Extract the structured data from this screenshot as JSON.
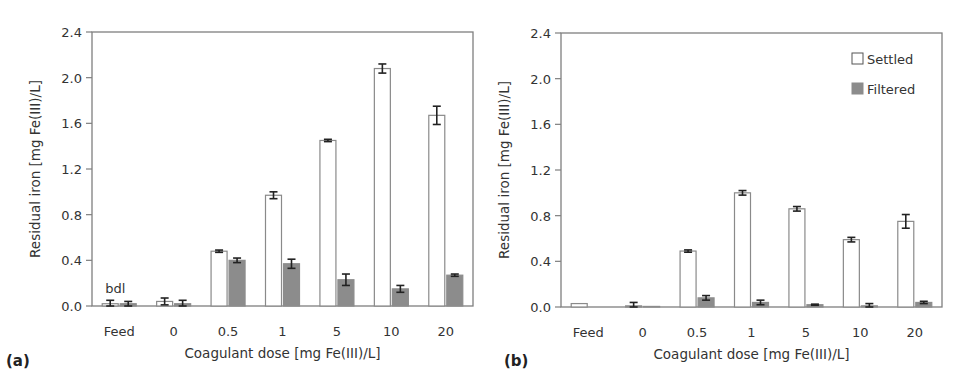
{
  "chart_data": [
    {
      "panel": "(a)",
      "type": "bar",
      "title": "",
      "xlabel": "Coagulant dose [mg Fe(III)/L]",
      "ylabel": "Residual iron [mg Fe(III)/L]",
      "ylim": [
        0,
        2.4
      ],
      "yticks": [
        "0.0",
        "0.4",
        "0.8",
        "1.2",
        "1.6",
        "2.0",
        "2.4"
      ],
      "categories": [
        "Feed",
        "0",
        "0.5",
        "1",
        "5",
        "10",
        "20"
      ],
      "series": [
        {
          "name": "Settled",
          "color": "#ffffff",
          "values": [
            0.02,
            0.04,
            0.48,
            0.97,
            1.45,
            2.08,
            1.67
          ],
          "errors": [
            0.03,
            0.03,
            0.01,
            0.03,
            0.01,
            0.04,
            0.08
          ]
        },
        {
          "name": "Filtered",
          "color": "#8c8c8c",
          "values": [
            0.02,
            0.02,
            0.4,
            0.37,
            0.23,
            0.15,
            0.27
          ],
          "errors": [
            0.02,
            0.03,
            0.02,
            0.04,
            0.05,
            0.03,
            0.01
          ]
        }
      ],
      "annotations": [
        {
          "text": "bdl",
          "category": "Feed"
        }
      ],
      "grid": false,
      "legend": false
    },
    {
      "panel": "(b)",
      "type": "bar",
      "title": "",
      "xlabel": "Coagulant dose [mg Fe(III)/L]",
      "ylabel": "Residual iron [mg Fe(III)/L]",
      "ylim": [
        0,
        2.4
      ],
      "yticks": [
        "0.0",
        "0.4",
        "0.8",
        "1.2",
        "1.6",
        "2.0",
        "2.4"
      ],
      "categories": [
        "Feed",
        "0",
        "0.5",
        "1",
        "5",
        "10",
        "20"
      ],
      "series": [
        {
          "name": "Settled",
          "color": "#ffffff",
          "values": [
            0.03,
            0.01,
            0.49,
            1.0,
            0.86,
            0.59,
            0.75
          ],
          "errors": [
            0.0,
            0.03,
            0.01,
            0.02,
            0.02,
            0.02,
            0.06
          ]
        },
        {
          "name": "Filtered",
          "color": "#8c8c8c",
          "values": [
            0.0,
            0.005,
            0.08,
            0.04,
            0.02,
            0.01,
            0.04
          ],
          "errors": [
            0.0,
            0.0,
            0.02,
            0.02,
            0.005,
            0.02,
            0.01
          ]
        }
      ],
      "grid": false,
      "legend": true,
      "legend_position": "top-right",
      "legend_entries": [
        "Settled",
        "Filtered"
      ]
    }
  ]
}
